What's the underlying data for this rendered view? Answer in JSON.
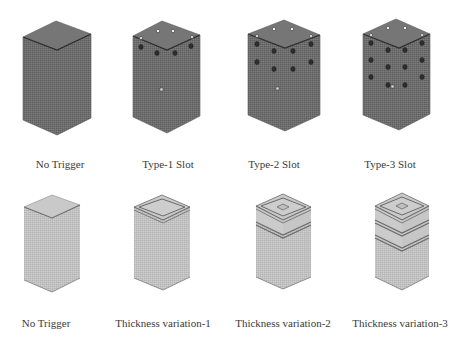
{
  "figure": {
    "rows": [
      {
        "name": "trigger-slot-row",
        "shade": "dark",
        "items": [
          {
            "label": "No Trigger",
            "type": "plain"
          },
          {
            "label": "Type-1 Slot",
            "type": "slot-1"
          },
          {
            "label": "Type-2 Slot",
            "type": "slot-2"
          },
          {
            "label": "Type-3 Slot",
            "type": "slot-3"
          }
        ]
      },
      {
        "name": "thickness-row",
        "shade": "light",
        "items": [
          {
            "label": "No Trigger",
            "type": "plain"
          },
          {
            "label": "Thickness variation-1",
            "type": "thick-1"
          },
          {
            "label": "Thickness variation-2",
            "type": "thick-2"
          },
          {
            "label": "Thickness variation-3",
            "type": "thick-3"
          }
        ]
      }
    ]
  },
  "colors": {
    "dark_face_left": "#6f6f6f",
    "dark_face_right": "#686868",
    "dark_top": "#7a7a7a",
    "light_face_left": "#c4c4c4",
    "light_face_right": "#bcbcbc",
    "light_top": "#cfcfcf",
    "edge": "#3a3a3a",
    "band": "#7c7c7c"
  }
}
